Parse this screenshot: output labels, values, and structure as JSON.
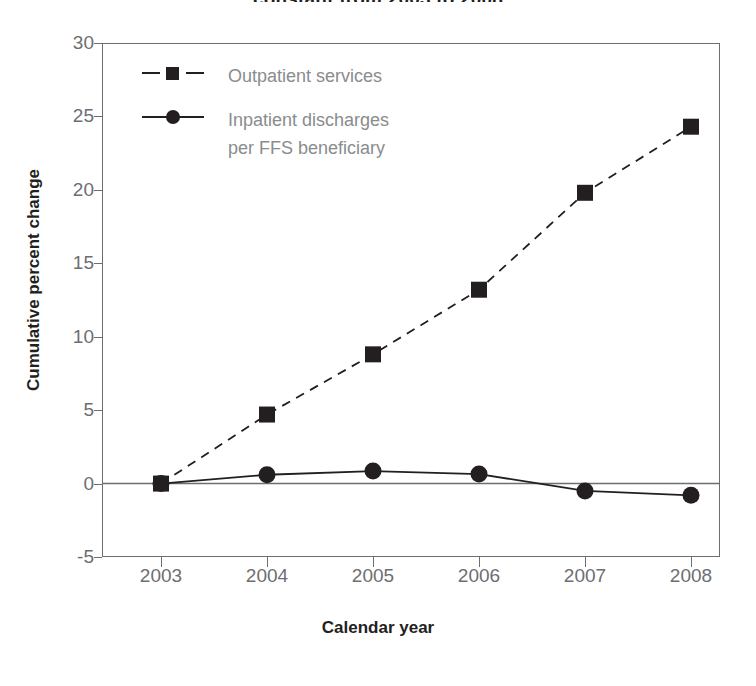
{
  "chart_data": {
    "type": "line",
    "title": "constant from 2003 to 2008",
    "xlabel": "Calendar year",
    "ylabel": "Cumulative percent change",
    "categories": [
      "2003",
      "2004",
      "2005",
      "2006",
      "2007",
      "2008"
    ],
    "x": [
      2003,
      2004,
      2005,
      2006,
      2007,
      2008
    ],
    "xlim": [
      2002.6,
      2008.5
    ],
    "ylim": [
      -5,
      30
    ],
    "ytick_labels": [
      "30",
      "25",
      "20",
      "15",
      "10",
      "5",
      "0",
      "-5"
    ],
    "yticks": [
      30,
      25,
      20,
      15,
      10,
      5,
      0,
      -5
    ],
    "grid": false,
    "legend_position": "upper left",
    "zero_line": true,
    "series": [
      {
        "name": "Outpatient services",
        "marker": "square",
        "linestyle": "dashed",
        "color": "#231f20",
        "values": [
          0.0,
          4.7,
          8.8,
          13.2,
          19.8,
          24.3
        ]
      },
      {
        "name": "Inpatient discharges per FFS beneficiary",
        "name_line1": "Inpatient discharges",
        "name_line2": "per FFS beneficiary",
        "marker": "circle",
        "linestyle": "solid",
        "color": "#231f20",
        "values": [
          0.0,
          0.6,
          0.85,
          0.65,
          -0.5,
          -0.8
        ]
      }
    ]
  },
  "axes": {
    "y_title": "Cumulative percent change",
    "x_title": "Calendar year",
    "y_labels": [
      "30",
      "25",
      "20",
      "15",
      "10",
      "5",
      "0",
      "-5"
    ],
    "x_labels": [
      "2003",
      "2004",
      "2005",
      "2006",
      "2007",
      "2008"
    ]
  },
  "legend": {
    "entry1": "Outpatient services",
    "entry2_line1": "Inpatient discharges",
    "entry2_line2": "per FFS beneficiary"
  },
  "colors": {
    "ink": "#231f20",
    "axis": "#6d6e71",
    "muted_text": "#8a8c8e",
    "background": "#ffffff"
  }
}
